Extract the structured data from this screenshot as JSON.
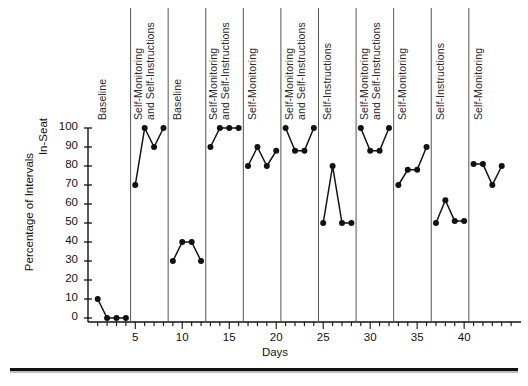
{
  "chart_data": {
    "type": "line",
    "title": "",
    "subtitle": "",
    "xlabel": "Days",
    "ylabel": "Percentage of Intervals\nIn-Seat",
    "ylabel_line1": "Percentage of Intervals",
    "ylabel_line2": "In-Seat",
    "xlim": [
      1,
      45
    ],
    "ylim": [
      0,
      100
    ],
    "ytick_values": [
      0,
      10,
      20,
      30,
      40,
      50,
      60,
      70,
      80,
      90,
      100
    ],
    "ytick_labels": [
      "0",
      "10",
      "20",
      "30",
      "40",
      "50",
      "60",
      "70",
      "80",
      "90",
      "100"
    ],
    "xtick_labeled": [
      5,
      10,
      15,
      20,
      25,
      30,
      35,
      40
    ],
    "xtick_labels": [
      "5",
      "10",
      "15",
      "20",
      "25",
      "30",
      "35",
      "40"
    ],
    "xtick_minor_step": 1,
    "grid": false,
    "legend": null,
    "marker": "filled-circle",
    "line_color": "#111111",
    "marker_color": "#111111",
    "phase_divider_color": "#555555",
    "phase_dividers_x": [
      4.5,
      8.5,
      12.5,
      16.5,
      20.5,
      24.5,
      28.5,
      32.5,
      36.5,
      40.5
    ],
    "phases": [
      {
        "label": "Baseline",
        "label_lines": [
          "Baseline"
        ],
        "x_start": 1,
        "x_end": 4,
        "x": [
          1,
          2,
          3,
          4
        ],
        "values": [
          10,
          0,
          0,
          0
        ]
      },
      {
        "label": "Self-Monitoring and Self-Instructions",
        "label_lines": [
          "Self-Monitoring",
          "and Self-Instructions"
        ],
        "x_start": 5,
        "x_end": 8,
        "x": [
          5,
          6,
          7,
          8
        ],
        "values": [
          70,
          100,
          90,
          100
        ]
      },
      {
        "label": "Baseline",
        "label_lines": [
          "Baseline"
        ],
        "x_start": 9,
        "x_end": 12,
        "x": [
          9,
          10,
          11,
          12
        ],
        "values": [
          30,
          40,
          40,
          30
        ]
      },
      {
        "label": "Self-Monitoring and Self-Instructions",
        "label_lines": [
          "Self-Monitoring",
          "and Self-Instructions"
        ],
        "x_start": 13,
        "x_end": 16,
        "x": [
          13,
          14,
          15,
          16
        ],
        "values": [
          90,
          100,
          100,
          100
        ]
      },
      {
        "label": "Self-Monitoring",
        "label_lines": [
          "Self-Monitoring"
        ],
        "x_start": 17,
        "x_end": 20,
        "x": [
          17,
          18,
          19,
          20
        ],
        "values": [
          80,
          90,
          80,
          88
        ]
      },
      {
        "label": "Self-Monitoring and Self-Instructions",
        "label_lines": [
          "Self-Monitoring",
          "and Self-Instructions"
        ],
        "x_start": 21,
        "x_end": 24,
        "x": [
          21,
          22,
          23,
          24
        ],
        "values": [
          100,
          88,
          88,
          100
        ]
      },
      {
        "label": "Self-Instructions",
        "label_lines": [
          "Self-Instructions"
        ],
        "x_start": 25,
        "x_end": 28,
        "x": [
          25,
          26,
          27,
          28
        ],
        "values": [
          50,
          80,
          50,
          50
        ]
      },
      {
        "label": "Self-Monitoring and Self-Instructions",
        "label_lines": [
          "Self-Monitoring",
          "and Self-Instructions"
        ],
        "x_start": 29,
        "x_end": 32,
        "x": [
          29,
          30,
          31,
          32
        ],
        "values": [
          100,
          88,
          88,
          100
        ]
      },
      {
        "label": "Self-Monitoring",
        "label_lines": [
          "Self-Monitoring"
        ],
        "x_start": 33,
        "x_end": 36,
        "x": [
          33,
          34,
          35,
          36
        ],
        "values": [
          70,
          78,
          78,
          90
        ]
      },
      {
        "label": "Self-Instructions",
        "label_lines": [
          "Self-Instructions"
        ],
        "x_start": 37,
        "x_end": 40,
        "x": [
          37,
          38,
          39,
          40
        ],
        "values": [
          50,
          62,
          51,
          51
        ]
      },
      {
        "label": "Self-Monitoring",
        "label_lines": [
          "Self-Monitoring"
        ],
        "x_start": 41,
        "x_end": 44,
        "x": [
          41,
          42,
          43,
          44
        ],
        "values": [
          81,
          81,
          70,
          80
        ]
      }
    ]
  }
}
